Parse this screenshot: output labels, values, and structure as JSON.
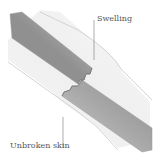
{
  "diagram": {
    "labels": {
      "swelling": "Swelling",
      "unbroken_skin": "Unbroken skin"
    },
    "colors": {
      "background": "#ffffff",
      "skin_fill": "#f4f4f4",
      "skin_outline": "#c8c8c8",
      "bone_dark": "#8f8f8f",
      "bone_mid": "#b5b5b5",
      "bone_light": "#e0e0e0",
      "leader_line": "#777777",
      "label_text": "#555555"
    }
  }
}
